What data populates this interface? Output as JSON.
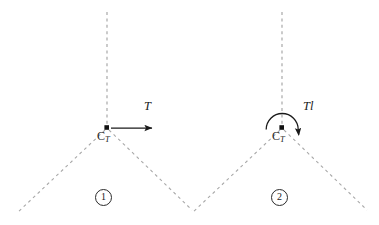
{
  "figure": {
    "type": "mechanics-free-body-diagram",
    "background_color": "#ffffff",
    "dash_color": "#a0a0a0",
    "ink_color": "#1a1a1a",
    "width": 379,
    "height": 225
  },
  "panels": [
    {
      "id": "panel-1",
      "number_label": "1",
      "vertex_label_main": "C",
      "vertex_label_sub": "T",
      "load_label": "T",
      "load_type": "horizontal-force-arrow",
      "vertex": {
        "x": 107,
        "y": 128
      },
      "apex_line_top": {
        "x": 107,
        "y": 12
      },
      "left_leg_end": {
        "x": 17,
        "y": 213
      },
      "right_leg_end": {
        "x": 192,
        "y": 210
      },
      "arrow_start": {
        "x": 110,
        "y": 128
      },
      "arrow_end": {
        "x": 154,
        "y": 128
      },
      "load_label_pos": {
        "x": 146,
        "y": 107
      },
      "vertex_label_pos": {
        "x": 98,
        "y": 135
      },
      "number_label_pos": {
        "x": 96,
        "y": 190
      }
    },
    {
      "id": "panel-2",
      "number_label": "2",
      "vertex_label_main": "C",
      "vertex_label_sub": "T",
      "load_label": "Tl",
      "load_type": "moment-curved-arrow",
      "vertex": {
        "x": 282,
        "y": 128
      },
      "apex_line_top": {
        "x": 282,
        "y": 12
      },
      "left_leg_end": {
        "x": 192,
        "y": 213
      },
      "right_leg_end": {
        "x": 367,
        "y": 210
      },
      "arc_start": {
        "x": 266,
        "y": 128
      },
      "arc_end": {
        "x": 298,
        "y": 128
      },
      "arc_radius": 16,
      "arrowhead_tip": {
        "x": 299,
        "y": 142
      },
      "load_label_pos": {
        "x": 304,
        "y": 107
      },
      "vertex_label_pos": {
        "x": 273,
        "y": 135
      },
      "number_label_pos": {
        "x": 272,
        "y": 190
      }
    }
  ]
}
